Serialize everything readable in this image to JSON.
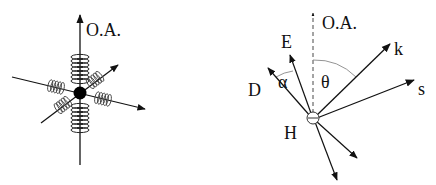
{
  "left_diagram": {
    "title": "Hydrogen atom as oscillator (springs along axes)",
    "axis_label": "O.A."
  },
  "right_diagram": {
    "axis_label": "O.A.",
    "labels": {
      "E": "E",
      "D": "D",
      "alpha": "α",
      "theta": "θ",
      "k": "k",
      "s": "s",
      "H": "H"
    }
  },
  "colors": {
    "ink": "#111111",
    "background": "#ffffff",
    "arc": "#888888"
  }
}
